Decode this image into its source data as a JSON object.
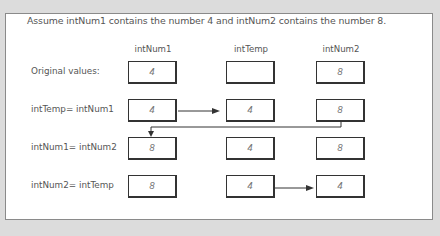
{
  "caption": "Assume intNum1 contains the number 4 and intNum2 contains the number 8.",
  "columns": [
    "intNum1",
    "intTemp",
    "intNum2"
  ],
  "rows": [
    {
      "label": "Original values:",
      "values": [
        "4",
        "",
        "8"
      ]
    },
    {
      "label": "intTemp= intNum1",
      "values": [
        "4",
        "4",
        "8"
      ]
    },
    {
      "label": "intNum1= intNum2",
      "values": [
        "8",
        "4",
        "8"
      ]
    },
    {
      "label": "intNum2= intTemp",
      "values": [
        "8",
        "4",
        "4"
      ]
    }
  ],
  "arrows": [
    {
      "row": 1,
      "from": "intNum1",
      "to": "intTemp"
    },
    {
      "row": 2,
      "from": "intNum2",
      "to": "intNum1"
    },
    {
      "row": 3,
      "from": "intTemp",
      "to": "intNum2"
    }
  ],
  "colors": {
    "background": "#dcdcdc",
    "panel": "#ffffff",
    "line": "#333333",
    "text": "#555555"
  }
}
